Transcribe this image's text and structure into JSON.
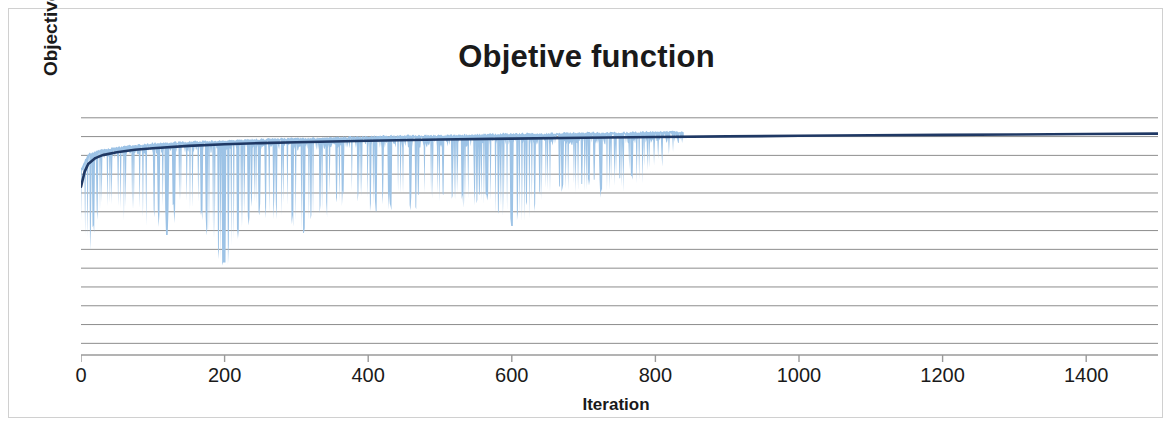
{
  "chart_data": {
    "type": "line",
    "title": "Objetive function",
    "subtitle": "",
    "xlabel": "Iteration",
    "ylabel": "Objective function (profit)",
    "xlim": [
      0,
      1500
    ],
    "ylim": [
      0,
      13
    ],
    "x_ticks": [
      0,
      200,
      400,
      600,
      800,
      1000,
      1200,
      1400
    ],
    "x_tick_labels": [
      "0",
      "200",
      "400",
      "600",
      "800",
      "1000",
      "1200",
      "1400"
    ],
    "y_ticks": [],
    "y_tick_labels": [],
    "grid": {
      "horizontal": true,
      "vertical": false,
      "color": "#808080",
      "count": 13
    },
    "legend": {
      "visible": false,
      "position": "none",
      "entries": []
    },
    "annotations": [],
    "colors": {
      "current_series": "#9DC3E6",
      "best_series": "#1F3864",
      "gridline": "#7f7f7f",
      "axis": "#808080",
      "text": "#1a1a1a",
      "background": "#ffffff",
      "border": "#d0d0d0"
    },
    "series": [
      {
        "name": "Current objective value",
        "type": "line",
        "color": "#9DC3E6",
        "description": "Noisy per-iteration objective value with frequent downward spikes; noise band ends near iteration 800",
        "noise_end_iteration": 800,
        "min_spike_iteration": 200,
        "min_spike_value": 4.7,
        "values_profile": [
          {
            "x": 0,
            "y_top": 9.55,
            "y_bottom": 6.3
          },
          {
            "x": 10,
            "y_top": 10.25,
            "y_bottom": 5.6
          },
          {
            "x": 25,
            "y_top": 10.45,
            "y_bottom": 7.1
          },
          {
            "x": 50,
            "y_top": 10.6,
            "y_bottom": 7.3
          },
          {
            "x": 75,
            "y_top": 10.7,
            "y_bottom": 7.0
          },
          {
            "x": 100,
            "y_top": 10.8,
            "y_bottom": 6.9
          },
          {
            "x": 130,
            "y_top": 10.85,
            "y_bottom": 7.2
          },
          {
            "x": 160,
            "y_top": 10.9,
            "y_bottom": 7.4
          },
          {
            "x": 200,
            "y_top": 10.95,
            "y_bottom": 4.7
          },
          {
            "x": 240,
            "y_top": 11.0,
            "y_bottom": 7.6
          },
          {
            "x": 280,
            "y_top": 11.05,
            "y_bottom": 7.3
          },
          {
            "x": 310,
            "y_top": 11.05,
            "y_bottom": 6.3
          },
          {
            "x": 350,
            "y_top": 11.1,
            "y_bottom": 7.8
          },
          {
            "x": 400,
            "y_top": 11.15,
            "y_bottom": 7.7
          },
          {
            "x": 450,
            "y_top": 11.2,
            "y_bottom": 7.9
          },
          {
            "x": 500,
            "y_top": 11.2,
            "y_bottom": 7.6
          },
          {
            "x": 550,
            "y_top": 11.25,
            "y_bottom": 8.0
          },
          {
            "x": 600,
            "y_top": 11.3,
            "y_bottom": 6.6
          },
          {
            "x": 650,
            "y_top": 11.3,
            "y_bottom": 8.1
          },
          {
            "x": 700,
            "y_top": 11.35,
            "y_bottom": 8.3
          },
          {
            "x": 750,
            "y_top": 11.35,
            "y_bottom": 8.6
          },
          {
            "x": 800,
            "y_top": 11.4,
            "y_bottom": 9.4
          },
          {
            "x": 840,
            "y_top": 11.4,
            "y_bottom": 11.1
          }
        ]
      },
      {
        "name": "Best objective value",
        "type": "line",
        "color": "#1F3864",
        "description": "Monotonically increasing best-so-far curve, rapid early rise then flat convergence",
        "x": [
          0,
          5,
          10,
          20,
          30,
          50,
          75,
          100,
          150,
          200,
          250,
          300,
          400,
          500,
          600,
          700,
          800,
          900,
          1000,
          1100,
          1200,
          1300,
          1400,
          1500
        ],
        "y": [
          8.55,
          9.3,
          9.7,
          10.0,
          10.15,
          10.3,
          10.42,
          10.5,
          10.62,
          10.7,
          10.76,
          10.8,
          10.88,
          10.94,
          10.99,
          11.03,
          11.07,
          11.1,
          11.13,
          11.16,
          11.18,
          11.2,
          11.22,
          11.24
        ]
      }
    ]
  },
  "chart": {
    "title": "Objetive function",
    "y_axis_title": "Objective function (profit)",
    "x_axis_title": "Iteration",
    "x_tick_labels": [
      "0",
      "200",
      "400",
      "600",
      "800",
      "1000",
      "1200",
      "1400"
    ]
  }
}
